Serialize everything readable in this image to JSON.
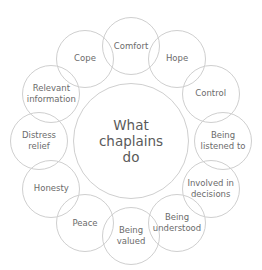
{
  "diagram": {
    "title": "What chaplains do",
    "center": {
      "label": "What\nchaplains\ndo",
      "cx": 131,
      "cy": 141,
      "r": 58
    },
    "ring": {
      "cx": 131,
      "cy": 141,
      "rx": 92,
      "ry": 95,
      "node_r": 29
    },
    "nodes": [
      {
        "label": "Comfort",
        "angle": 0
      },
      {
        "label": "Hope",
        "angle": 30
      },
      {
        "label": "Control",
        "angle": 60
      },
      {
        "label": "Being\nlistened to",
        "angle": 90
      },
      {
        "label": "Involved in\ndecisions",
        "angle": 120
      },
      {
        "label": "Being\nunderstood",
        "angle": 150
      },
      {
        "label": "Being\nvalued",
        "angle": 180
      },
      {
        "label": "Peace",
        "angle": 210
      },
      {
        "label": "Honesty",
        "angle": 240
      },
      {
        "label": "Distress\nrelief",
        "angle": 270
      },
      {
        "label": "Relevant\ninformation",
        "angle": 300
      },
      {
        "label": "Cope",
        "angle": 330
      }
    ],
    "colors": {
      "stroke": "#cfcfcf",
      "text": "#6b6b6b",
      "center_text": "#5a5a5a"
    }
  }
}
